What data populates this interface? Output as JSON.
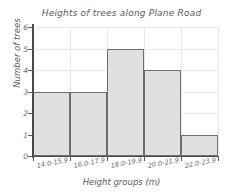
{
  "chart_data": {
    "type": "bar",
    "title": "Heights of trees along Plane Road",
    "xlabel": "Height groups (m)",
    "ylabel": "Number of trees",
    "categories": [
      "14.0-15.9",
      "16.0-17.9",
      "18.0-19.9",
      "20.0-21.9",
      "22.0-23.9"
    ],
    "values": [
      3,
      3,
      5,
      4,
      1
    ],
    "ylim": [
      0,
      6
    ],
    "ytick_labels": [
      "0",
      "1",
      "2",
      "3",
      "4",
      "5",
      "6"
    ],
    "grid": true,
    "legend": null,
    "colors": {
      "bar_fill": "#e0e0e0",
      "bar_border": "#6e6e6e",
      "gridline": "#e9e9e9",
      "axis": "#4a4a4a",
      "text": "#5a5a5a",
      "background": "#ffffff"
    }
  }
}
